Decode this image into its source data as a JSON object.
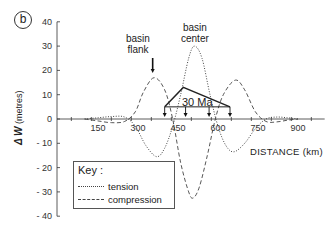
{
  "panel": {
    "label": "b"
  },
  "chart_data": {
    "type": "line",
    "title": "",
    "xlabel": "DISTANCE (km)",
    "ylabel": "ΔW (metres)",
    "xlim": [
      0,
      1000
    ],
    "ylim": [
      -40,
      40
    ],
    "xticks": [
      150,
      300,
      450,
      600,
      750,
      900
    ],
    "yticks": [
      -40,
      -30,
      -20,
      -10,
      0,
      10,
      20,
      30,
      40
    ],
    "grid": false,
    "legend_position": "lower left",
    "series": [
      {
        "name": "tension",
        "style": "dotted",
        "x": [
          100,
          150,
          200,
          250,
          290,
          330,
          370,
          400,
          430,
          460,
          490,
          512,
          540,
          570,
          600,
          630,
          660,
          700,
          740,
          780,
          820,
          860,
          900
        ],
        "y": [
          0,
          0.5,
          1,
          0.8,
          -3,
          -11,
          -15.5,
          -12,
          -3,
          10,
          25,
          30,
          25,
          10,
          -3,
          -11,
          -13.5,
          -10,
          -4,
          0,
          0.8,
          0.5,
          0
        ]
      },
      {
        "name": "compression",
        "style": "dashed",
        "x": [
          100,
          150,
          200,
          250,
          290,
          320,
          360,
          400,
          430,
          460,
          490,
          507,
          530,
          560,
          590,
          620,
          665,
          700,
          740,
          780,
          820,
          860,
          900
        ],
        "y": [
          0,
          -0.8,
          -1.5,
          -1,
          3,
          11,
          17,
          12,
          0,
          -18,
          -30,
          -32.5,
          -28,
          -15,
          0,
          10,
          16,
          12,
          3,
          -1,
          -1.2,
          -0.5,
          0
        ]
      }
    ],
    "annotations": [
      {
        "text": "basin flank",
        "x": 355,
        "y": 25,
        "arrow": "down"
      },
      {
        "text": "basin center",
        "x": 512,
        "y": 35
      },
      {
        "text": "30 Ma",
        "type": "load-triangle",
        "x_range": [
          400,
          645
        ],
        "apex_x": 470,
        "apex_y": 13,
        "base_y": 5
      }
    ]
  },
  "axes": {
    "y_tick_labels": [
      "40",
      "30",
      "20",
      "10",
      "0",
      "- 10",
      "- 20",
      "- 30",
      "- 40"
    ],
    "x_tick_labels": [
      "150",
      "300",
      "450",
      "600",
      "750",
      "900"
    ],
    "ylabel_symbol": "Δ W",
    "ylabel_units": "(metres)",
    "xlabel": "DISTANCE (km)"
  },
  "annotations": {
    "basin_flank": "basin flank",
    "basin_flank_line1": "basin",
    "basin_flank_line2": "flank",
    "basin_center_line1": "basin",
    "basin_center_line2": "center",
    "load_label": "30 Ma"
  },
  "legend": {
    "title": "Key :",
    "items": [
      {
        "label": "tension",
        "style": "dotted"
      },
      {
        "label": "compression",
        "style": "dashed"
      }
    ]
  }
}
